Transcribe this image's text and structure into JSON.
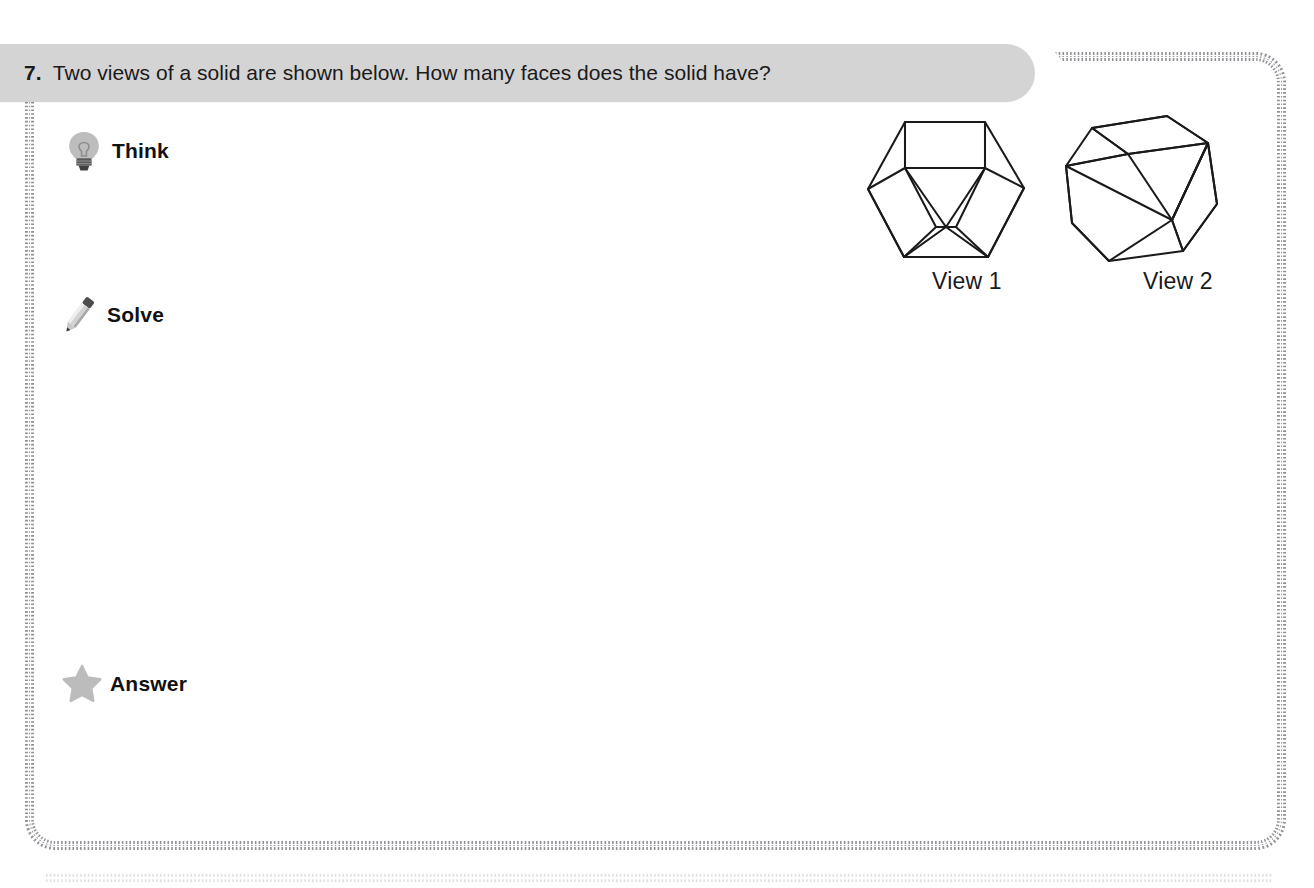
{
  "question": {
    "number": "7.",
    "text": "Two views of a solid are shown below. How many faces does the solid have?"
  },
  "steps": [
    {
      "icon": "lightbulb-icon",
      "label": "Think"
    },
    {
      "icon": "pencil-icon",
      "label": "Solve"
    },
    {
      "icon": "star-icon",
      "label": "Answer"
    }
  ],
  "figures": [
    {
      "name": "view-1-polyhedron",
      "caption": "View 1"
    },
    {
      "name": "view-2-polyhedron",
      "caption": "View 2"
    }
  ],
  "colors": {
    "header_bar": "#d4d4d4",
    "text": "#1a1a1a",
    "icon_gray": "#b8b8b8",
    "icon_dark": "#4a4a4a",
    "border_dash": "#8c8c92",
    "figure_stroke": "#1a1a1a",
    "page_background": "#ffffff"
  }
}
